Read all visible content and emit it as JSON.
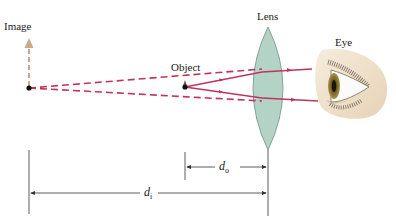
{
  "labels": {
    "image": "Image",
    "object": "Object",
    "lens": "Lens",
    "eye": "Eye"
  },
  "dimensions": {
    "object_distance": {
      "symbol": "d",
      "subscript": "o"
    },
    "image_distance": {
      "symbol": "d",
      "subscript": "i"
    }
  },
  "colors": {
    "ray": "#c0345c",
    "virtual_ray": "#c0345c",
    "image_arrow": "#c8a98a",
    "lens_fill": "#b4d3c7",
    "lens_stroke": "#6f8f84",
    "dimension_line": "#333333",
    "skin": "#efe2cc",
    "iris": "#8a7a3c"
  },
  "geometry": {
    "image_point": [
      29,
      88
    ],
    "object_point": [
      185,
      87
    ],
    "lens_center_x": 268,
    "lens_top_y": 27,
    "lens_bottom_y": 150
  }
}
